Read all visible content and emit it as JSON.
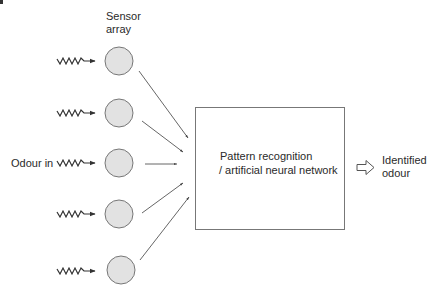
{
  "diagram": {
    "labels": {
      "sensor_array_line1": "Sensor",
      "sensor_array_line2": "array",
      "odour_in": "Odour in",
      "processor_line1": "Pattern recognition",
      "processor_line2": "/ artificial neural network",
      "output_line1": "Identified",
      "output_line2": "odour"
    },
    "sensors": [
      {
        "id": 1,
        "cx": 119,
        "cy": 61,
        "r": 14
      },
      {
        "id": 2,
        "cx": 119,
        "cy": 113,
        "r": 14
      },
      {
        "id": 3,
        "cx": 119,
        "cy": 163,
        "r": 14
      },
      {
        "id": 4,
        "cx": 119,
        "cy": 214,
        "r": 14
      },
      {
        "id": 5,
        "cx": 121,
        "cy": 270,
        "r": 14
      }
    ],
    "processor_box": {
      "x": 195,
      "y": 107,
      "width": 149,
      "height": 122
    },
    "colors": {
      "sensor_fill": "#e2e2e2",
      "sensor_stroke": "#777777",
      "line": "#555555",
      "box_stroke": "#777777",
      "text": "#2a2a2a"
    }
  }
}
